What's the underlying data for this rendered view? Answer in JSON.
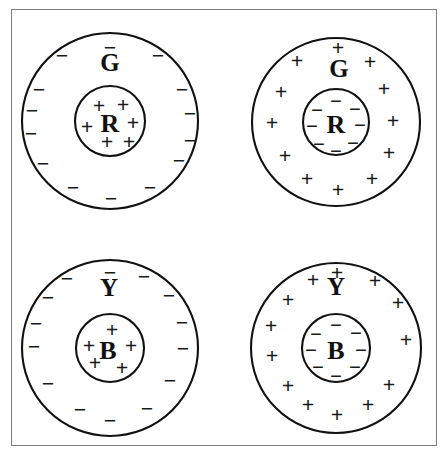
{
  "figure": {
    "background_color": "#ffffff",
    "frame_color": "#7d7d7d",
    "stroke_color": "#111111",
    "canvas": {
      "width": 447,
      "height": 457
    },
    "frame": {
      "x": 11,
      "y": 9,
      "width": 426,
      "height": 437
    }
  },
  "panels": [
    {
      "id": "top-left",
      "center": {
        "x": 110,
        "y": 121
      },
      "outer": {
        "label": "G",
        "radius": 88,
        "label_position": {
          "x": 110,
          "y": 62
        },
        "label_font_size": 25,
        "charge_sign": "−",
        "charge_count": 14,
        "charge_font_size": 22,
        "charges": [
          {
            "x": 110,
            "y": 47
          },
          {
            "x": 62,
            "y": 55
          },
          {
            "x": 158,
            "y": 55
          },
          {
            "x": 39,
            "y": 89
          },
          {
            "x": 182,
            "y": 89
          },
          {
            "x": 32,
            "y": 110
          },
          {
            "x": 190,
            "y": 113
          },
          {
            "x": 31,
            "y": 133
          },
          {
            "x": 190,
            "y": 140
          },
          {
            "x": 43,
            "y": 163
          },
          {
            "x": 179,
            "y": 160
          },
          {
            "x": 73,
            "y": 187
          },
          {
            "x": 150,
            "y": 187
          },
          {
            "x": 111,
            "y": 198
          }
        ]
      },
      "inner": {
        "label": "R",
        "radius": 35,
        "label_position": {
          "x": 110,
          "y": 123
        },
        "label_font_size": 26,
        "charge_sign": "+",
        "charge_count": 5,
        "charge_font_size": 22,
        "charges": [
          {
            "x": 99,
            "y": 105
          },
          {
            "x": 123,
            "y": 104
          },
          {
            "x": 87,
            "y": 126
          },
          {
            "x": 133,
            "y": 122
          },
          {
            "x": 107,
            "y": 141
          },
          {
            "x": 129,
            "y": 141
          }
        ]
      }
    },
    {
      "id": "top-right",
      "center": {
        "x": 336,
        "y": 122
      },
      "outer": {
        "label": "G",
        "radius": 84,
        "label_position": {
          "x": 339,
          "y": 68
        },
        "label_font_size": 25,
        "charge_sign": "+",
        "charge_count": 14,
        "charge_font_size": 22,
        "charges": [
          {
            "x": 338,
            "y": 47
          },
          {
            "x": 297,
            "y": 60
          },
          {
            "x": 370,
            "y": 61
          },
          {
            "x": 281,
            "y": 91
          },
          {
            "x": 384,
            "y": 88
          },
          {
            "x": 272,
            "y": 122
          },
          {
            "x": 393,
            "y": 120
          },
          {
            "x": 285,
            "y": 155
          },
          {
            "x": 389,
            "y": 152
          },
          {
            "x": 307,
            "y": 178
          },
          {
            "x": 372,
            "y": 178
          },
          {
            "x": 338,
            "y": 189
          }
        ]
      },
      "inner": {
        "label": "R",
        "radius": 33,
        "label_position": {
          "x": 336,
          "y": 124
        },
        "label_font_size": 26,
        "charge_sign": "−",
        "charge_count": 7,
        "charge_font_size": 21,
        "charges": [
          {
            "x": 336,
            "y": 101
          },
          {
            "x": 317,
            "y": 110
          },
          {
            "x": 355,
            "y": 109
          },
          {
            "x": 312,
            "y": 126
          },
          {
            "x": 360,
            "y": 125
          },
          {
            "x": 319,
            "y": 144
          },
          {
            "x": 353,
            "y": 143
          },
          {
            "x": 336,
            "y": 151
          }
        ]
      }
    },
    {
      "id": "bottom-left",
      "center": {
        "x": 110,
        "y": 348
      },
      "outer": {
        "label": "Y",
        "radius": 88,
        "label_position": {
          "x": 109,
          "y": 287
        },
        "label_font_size": 25,
        "charge_sign": "−",
        "charge_count": 14,
        "charge_font_size": 22,
        "charges": [
          {
            "x": 110,
            "y": 272
          },
          {
            "x": 67,
            "y": 278
          },
          {
            "x": 144,
            "y": 276
          },
          {
            "x": 48,
            "y": 297
          },
          {
            "x": 169,
            "y": 295
          },
          {
            "x": 36,
            "y": 323
          },
          {
            "x": 182,
            "y": 322
          },
          {
            "x": 34,
            "y": 346
          },
          {
            "x": 183,
            "y": 348
          },
          {
            "x": 48,
            "y": 383
          },
          {
            "x": 170,
            "y": 380
          },
          {
            "x": 80,
            "y": 409
          },
          {
            "x": 147,
            "y": 408
          },
          {
            "x": 110,
            "y": 420
          }
        ]
      },
      "inner": {
        "label": "B",
        "radius": 34,
        "label_position": {
          "x": 108,
          "y": 350
        },
        "label_font_size": 26,
        "charge_sign": "+",
        "charge_count": 5,
        "charge_font_size": 22,
        "charges": [
          {
            "x": 112,
            "y": 329
          },
          {
            "x": 89,
            "y": 345
          },
          {
            "x": 131,
            "y": 345
          },
          {
            "x": 95,
            "y": 362
          },
          {
            "x": 122,
            "y": 367
          }
        ]
      }
    },
    {
      "id": "bottom-right",
      "center": {
        "x": 336,
        "y": 348
      },
      "outer": {
        "label": "Y",
        "radius": 85,
        "label_position": {
          "x": 336,
          "y": 286
        },
        "label_font_size": 25,
        "charge_sign": "+",
        "charge_count": 14,
        "charge_font_size": 22,
        "charges": [
          {
            "x": 337,
            "y": 272
          },
          {
            "x": 313,
            "y": 279
          },
          {
            "x": 375,
            "y": 280
          },
          {
            "x": 288,
            "y": 299
          },
          {
            "x": 398,
            "y": 302
          },
          {
            "x": 271,
            "y": 325
          },
          {
            "x": 406,
            "y": 339
          },
          {
            "x": 272,
            "y": 355
          },
          {
            "x": 288,
            "y": 385
          },
          {
            "x": 389,
            "y": 384
          },
          {
            "x": 308,
            "y": 404
          },
          {
            "x": 368,
            "y": 404
          },
          {
            "x": 337,
            "y": 414
          }
        ]
      },
      "inner": {
        "label": "B",
        "radius": 34,
        "label_position": {
          "x": 336,
          "y": 350
        },
        "label_font_size": 26,
        "charge_sign": "−",
        "charge_count": 7,
        "charge_font_size": 21,
        "charges": [
          {
            "x": 336,
            "y": 325
          },
          {
            "x": 316,
            "y": 334
          },
          {
            "x": 356,
            "y": 333
          },
          {
            "x": 311,
            "y": 350
          },
          {
            "x": 361,
            "y": 350
          },
          {
            "x": 318,
            "y": 367
          },
          {
            "x": 355,
            "y": 367
          },
          {
            "x": 336,
            "y": 376
          }
        ]
      }
    }
  ]
}
